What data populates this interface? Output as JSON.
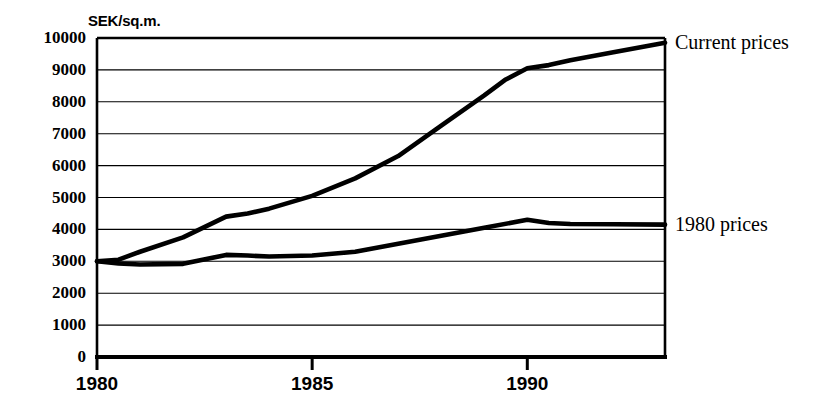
{
  "chart_data": {
    "type": "line",
    "title": "",
    "subtitle": "",
    "ylabel": "SEK/sq.m.",
    "xlabel": "",
    "ylim": [
      0,
      10000
    ],
    "xlim": [
      1980,
      1993.2
    ],
    "ytick_labels": [
      "10000",
      "9000",
      "8000",
      "7000",
      "6000",
      "5000",
      "4000",
      "3000",
      "2000",
      "1000",
      "0"
    ],
    "ytick_values": [
      10000,
      9000,
      8000,
      7000,
      6000,
      5000,
      4000,
      3000,
      2000,
      1000,
      0
    ],
    "xtick_labels": [
      "1980",
      "1985",
      "1990"
    ],
    "xtick_values": [
      1980,
      1985,
      1990
    ],
    "grid": "horizontal",
    "legend_position": "right-of-line-ends",
    "line_color": "#000000",
    "series": [
      {
        "name": "Current prices",
        "label": "Current prices",
        "x": [
          1980,
          1980.5,
          1981,
          1982,
          1983,
          1983.5,
          1984,
          1985,
          1986,
          1987,
          1988,
          1989,
          1989.5,
          1990,
          1990.5,
          1991,
          1992,
          1993.2
        ],
        "values": [
          3000,
          3050,
          3300,
          3750,
          4400,
          4500,
          4650,
          5050,
          5600,
          6300,
          7250,
          8200,
          8700,
          9050,
          9150,
          9300,
          9550,
          9850
        ]
      },
      {
        "name": "1980 prices",
        "label": "1980 prices",
        "x": [
          1980,
          1980.5,
          1981,
          1982,
          1983,
          1983.5,
          1984,
          1985,
          1986,
          1987,
          1988,
          1989,
          1990,
          1990.5,
          1991,
          1992,
          1993.2
        ],
        "values": [
          3000,
          2930,
          2900,
          2920,
          3200,
          3180,
          3150,
          3180,
          3300,
          3550,
          3800,
          4050,
          4300,
          4200,
          4170,
          4160,
          4150
        ]
      }
    ]
  },
  "annotations": {
    "current_prices_label": "Current prices",
    "nineteen80_prices_label": "1980 prices"
  }
}
